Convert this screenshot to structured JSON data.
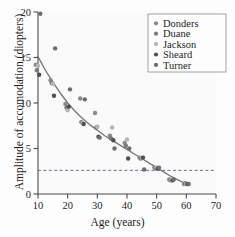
{
  "chart_data": {
    "type": "scatter",
    "title": "",
    "xlabel": "Age (years)",
    "ylabel": "Amplitude of accomodation (diopters)",
    "xlim": [
      10,
      70
    ],
    "ylim": [
      0,
      20
    ],
    "xticks": [
      10,
      20,
      30,
      40,
      50,
      60,
      70
    ],
    "yticks": [
      0,
      5,
      10,
      15,
      20
    ],
    "grid": false,
    "legend_position": "top-right",
    "legend_entries": [
      "Donders",
      "Duane",
      "Jackson",
      "Sheard",
      "Turner"
    ],
    "series": [
      {
        "name": "Donders",
        "color": "#8a8a8a",
        "points": [
          [
            10,
            14.2
          ],
          [
            15,
            12.5
          ],
          [
            20,
            9.9
          ],
          [
            25,
            10.5
          ],
          [
            30,
            8.9
          ],
          [
            35,
            6.4
          ],
          [
            40,
            5.6
          ],
          [
            45,
            4.0
          ],
          [
            50,
            2.9
          ],
          [
            55,
            1.6
          ],
          [
            60,
            1.1
          ]
        ]
      },
      {
        "name": "Duane",
        "color": "#7a7a7a",
        "points": [
          [
            10,
            13.6
          ],
          [
            15,
            12.2
          ],
          [
            20,
            9.5
          ],
          [
            25,
            7.9
          ],
          [
            30,
            7.3
          ],
          [
            35,
            6.1
          ],
          [
            40,
            5.3
          ],
          [
            45,
            3.9
          ],
          [
            50,
            2.8
          ],
          [
            55,
            1.5
          ],
          [
            60,
            1.2
          ]
        ]
      },
      {
        "name": "Jackson",
        "color": "#b5b5b5",
        "points": [
          [
            10,
            14.1
          ],
          [
            15,
            12.1
          ],
          [
            20,
            9.2
          ],
          [
            25,
            7.8
          ],
          [
            30,
            7.4
          ],
          [
            35,
            7.3
          ],
          [
            40,
            6.0
          ],
          [
            45,
            4.0
          ],
          [
            50,
            2.9
          ],
          [
            55,
            1.5
          ],
          [
            60,
            1.1
          ]
        ]
      },
      {
        "name": "Sheard",
        "color": "#4f4f4f",
        "points": [
          [
            10,
            13.1
          ],
          [
            15,
            10.8
          ],
          [
            20,
            9.6
          ],
          [
            25,
            7.7
          ],
          [
            30,
            6.3
          ],
          [
            35,
            5.9
          ],
          [
            40,
            3.9
          ],
          [
            45,
            4.0
          ],
          [
            50,
            2.8
          ],
          [
            55,
            1.5
          ],
          [
            60,
            1.1
          ]
        ]
      },
      {
        "name": "Turner",
        "color": "#6d6d6d",
        "points": [
          [
            10,
            19.8
          ],
          [
            15,
            16.0
          ],
          [
            20,
            11.5
          ],
          [
            25,
            10.4
          ],
          [
            30,
            6.2
          ],
          [
            35,
            5.0
          ],
          [
            40,
            5.0
          ],
          [
            45,
            2.7
          ],
          [
            50,
            2.9
          ],
          [
            55,
            1.6
          ],
          [
            60,
            1.1
          ]
        ]
      }
    ],
    "fit_curve": {
      "name": "trend-line",
      "color": "#777777",
      "points": [
        [
          10,
          15.1
        ],
        [
          12.5,
          13.6
        ],
        [
          15,
          12.3
        ],
        [
          17.5,
          11.1
        ],
        [
          20,
          10.0
        ],
        [
          22.5,
          9.1
        ],
        [
          25,
          8.3
        ],
        [
          27.5,
          7.6
        ],
        [
          30,
          7.0
        ],
        [
          32.5,
          6.4
        ],
        [
          35,
          5.9
        ],
        [
          37.5,
          5.4
        ],
        [
          40,
          4.9
        ],
        [
          42.5,
          4.4
        ],
        [
          45,
          3.9
        ],
        [
          47.5,
          3.4
        ],
        [
          50,
          2.9
        ],
        [
          52.5,
          2.4
        ],
        [
          55,
          1.9
        ],
        [
          57.5,
          1.5
        ],
        [
          60,
          1.1
        ]
      ]
    },
    "reference_line": {
      "name": "threshold",
      "orientation": "horizontal",
      "value": 2.6,
      "style": "dashed",
      "color": "#6b6b89"
    }
  },
  "axes": {
    "x_tick_labels": [
      "10",
      "20",
      "30",
      "40",
      "50",
      "60",
      "70"
    ],
    "y_tick_labels": [
      "0",
      "5",
      "10",
      "15",
      "20"
    ]
  },
  "legend": {
    "items": [
      {
        "label": "Donders",
        "marker_color": "#8a8a8a"
      },
      {
        "label": "Duane",
        "marker_color": "#7a7a7a"
      },
      {
        "label": "Jackson",
        "marker_color": "#b5b5b5"
      },
      {
        "label": "Sheard",
        "marker_color": "#4f4f4f"
      },
      {
        "label": "Turner",
        "marker_color": "#6d6d6d"
      }
    ]
  },
  "colors": {
    "axis": "#4a4a4a",
    "text": "#1d1d1d",
    "background": "#fdfdfd",
    "plot_background": "#fafafa",
    "curve": "#777777",
    "reference": "#6b6b89",
    "legend_border": "#9a9a9a"
  }
}
